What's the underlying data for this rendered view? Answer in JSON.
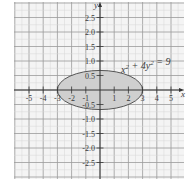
{
  "chart_data": {
    "type": "line",
    "title": "",
    "xlabel": "x",
    "ylabel": "y",
    "xlim": [
      -6,
      6
    ],
    "ylim": [
      -3,
      3
    ],
    "grid": true,
    "x_ticks": [
      -5,
      -4,
      -3,
      -2,
      -1,
      1,
      2,
      3,
      4,
      5
    ],
    "x_tick_labels": [
      "-5",
      "-4",
      "-3",
      "-2",
      "-1",
      "1",
      "2",
      "3",
      "4",
      "5"
    ],
    "y_ticks": [
      2.5,
      2.0,
      1.5,
      1.0,
      0.5,
      -0.5,
      -1.0,
      -1.5,
      -2.0,
      -2.5
    ],
    "y_tick_labels": [
      "2.5",
      "2.0",
      "1.5",
      "1.0",
      "0.5",
      "-0.5",
      "-1.0",
      "-1.5",
      "-2.0",
      "-2.5"
    ],
    "series": [
      {
        "name": "x^2 + 4y^2 = 9",
        "shape": "ellipse",
        "center": [
          0,
          0
        ],
        "semi_axis_x": 3,
        "semi_axis_y": 1.5,
        "filled": true
      }
    ],
    "annotations": [
      {
        "text": "x² + 4y² = 9",
        "position": [
          1.5,
          0.8
        ]
      }
    ]
  },
  "colors": {
    "background": "#f4f4f4",
    "grid_major": "#9a9a9a",
    "grid_minor": "#d6d6d6",
    "axis": "#333333",
    "ellipse_fill": "#cfcfcf",
    "ellipse_stroke": "#555555",
    "text": "#3a3a3a"
  },
  "labels": {
    "x_axis": "x",
    "y_axis": "y",
    "equation": "x² + 4y² = 9"
  }
}
